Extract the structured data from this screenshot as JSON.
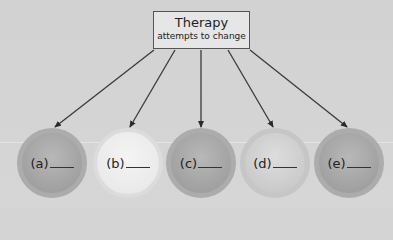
{
  "diagram": {
    "top_box": {
      "title": "Therapy",
      "subtitle": "attempts to change"
    },
    "targets": [
      {
        "label": "(a)",
        "blank": "____",
        "shade": "dark"
      },
      {
        "label": "(b)",
        "blank": "____",
        "shade": "light"
      },
      {
        "label": "(c)",
        "blank": "____",
        "shade": "dark"
      },
      {
        "label": "(d)",
        "blank": "____",
        "shade": "mid"
      },
      {
        "label": "(e)",
        "blank": "____",
        "shade": "dark"
      }
    ],
    "colors": {
      "background": "#d4d4d4",
      "box_border": "#555555",
      "arrow": "#333333"
    }
  }
}
